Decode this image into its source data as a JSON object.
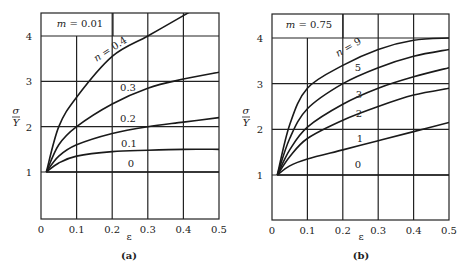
{
  "chart_data": [
    {
      "type": "line",
      "panel_label": "(a)",
      "title": "",
      "annotation": "m = 0.01",
      "annotation_param": "m",
      "annotation_value": "0.01",
      "xlabel": "ε",
      "ylabel_num": "σ",
      "ylabel_den": "Y",
      "xlim": [
        0,
        0.5
      ],
      "ylim": [
        0,
        4.45
      ],
      "x_ticks": [
        "0",
        "0.1",
        "0.2",
        "0.3",
        "0.4",
        "0.5"
      ],
      "y_ticks": [
        "1",
        "2",
        "3",
        "4"
      ],
      "grid": true,
      "x": [
        0.015,
        0.05,
        0.1,
        0.2,
        0.3,
        0.4,
        0.5
      ],
      "series": [
        {
          "name": "n = 0.4",
          "label": "n = 0.4",
          "values": [
            1.0,
            2.0,
            2.65,
            3.55,
            4.0,
            4.45,
            null
          ]
        },
        {
          "name": "0.3",
          "label": "0.3",
          "values": [
            1.0,
            1.6,
            2.0,
            2.5,
            2.85,
            3.05,
            3.2
          ]
        },
        {
          "name": "0.2",
          "label": "0.2",
          "values": [
            1.0,
            1.35,
            1.6,
            1.85,
            2.0,
            2.1,
            2.2
          ]
        },
        {
          "name": "0.1",
          "label": "0.1",
          "values": [
            1.0,
            1.2,
            1.35,
            1.45,
            1.48,
            1.5,
            1.5
          ]
        },
        {
          "name": "0",
          "label": "0",
          "values": [
            1.0,
            1.0,
            1.0,
            1.0,
            1.0,
            1.0,
            1.0
          ]
        }
      ]
    },
    {
      "type": "line",
      "panel_label": "(b)",
      "title": "",
      "annotation": "m = 0.75",
      "annotation_param": "m",
      "annotation_value": "0.75",
      "xlabel": "ε",
      "ylabel_num": "σ",
      "ylabel_den": "Y",
      "xlim": [
        0,
        0.5
      ],
      "ylim": [
        0,
        4.45
      ],
      "x_ticks": [
        "0",
        "0.1",
        "0.2",
        "0.3",
        "0.4",
        "0.5"
      ],
      "y_ticks": [
        "1",
        "2",
        "3",
        "4"
      ],
      "grid": true,
      "x": [
        0.015,
        0.05,
        0.1,
        0.2,
        0.3,
        0.4,
        0.5
      ],
      "series": [
        {
          "name": "n = 9",
          "label": "n = 9",
          "values": [
            1.0,
            2.1,
            2.9,
            3.4,
            3.75,
            3.95,
            4.0
          ]
        },
        {
          "name": "5",
          "label": "5",
          "values": [
            1.0,
            1.8,
            2.45,
            3.0,
            3.35,
            3.6,
            3.75
          ]
        },
        {
          "name": "3",
          "label": "3",
          "values": [
            1.0,
            1.55,
            2.05,
            2.55,
            2.9,
            3.15,
            3.35
          ]
        },
        {
          "name": "2",
          "label": "2",
          "values": [
            1.0,
            1.4,
            1.8,
            2.2,
            2.5,
            2.75,
            2.9
          ]
        },
        {
          "name": "1",
          "label": "1",
          "values": [
            1.0,
            1.2,
            1.35,
            1.55,
            1.75,
            1.95,
            2.15
          ]
        },
        {
          "name": "0",
          "label": "0",
          "values": [
            1.0,
            1.0,
            1.0,
            1.0,
            1.0,
            1.0,
            1.0
          ]
        }
      ]
    }
  ]
}
